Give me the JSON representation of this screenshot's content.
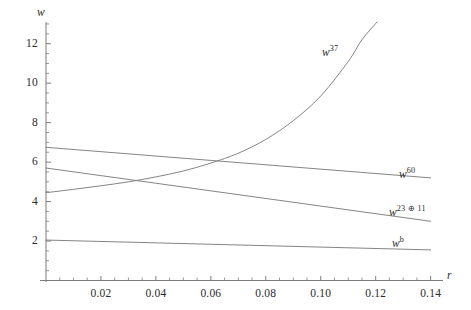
{
  "figure": {
    "background": "#ffffff",
    "line_color": "#7d7d7d",
    "axis_color": "#6e6e6e",
    "text_color": "#2b2b2b"
  },
  "axes": {
    "x_axis_name": "r",
    "y_axis_name": "w",
    "x_ticks": [
      "0.02",
      "0.04",
      "0.06",
      "0.08",
      "0.10",
      "0.12",
      "0.14"
    ],
    "x_tick_values": [
      0.02,
      0.04,
      0.06,
      0.08,
      0.1,
      0.12,
      0.14
    ],
    "y_ticks": [
      "2",
      "4",
      "6",
      "8",
      "10",
      "12"
    ],
    "y_tick_values": [
      2,
      4,
      6,
      8,
      10,
      12
    ],
    "xlim": [
      0,
      0.1445
    ],
    "ylim": [
      0,
      13.1
    ],
    "x_minor_per_major": 4,
    "y_minor_per_major": 4,
    "grid": false
  },
  "labels": {
    "curve_37_base": "w",
    "curve_37_exp": "37",
    "curve_60_base": "w",
    "curve_60_exp": "60",
    "curve_23x11_base": "w",
    "curve_23x11_exp": "23 ⊕ 11",
    "curve_b_base": "w",
    "curve_b_exp": "b"
  },
  "chart_data": {
    "type": "line",
    "title": "",
    "xlabel": "r",
    "ylabel": "w",
    "xlim": [
      0,
      0.1445
    ],
    "ylim": [
      0,
      13.1
    ],
    "grid": false,
    "legend": "inline-curve-labels",
    "series": [
      {
        "name": "w^37",
        "label": "w^37",
        "annotation_at": {
          "r": 0.098,
          "w": 10.6
        },
        "x": [
          0.0,
          0.01,
          0.02,
          0.03,
          0.04,
          0.05,
          0.06,
          0.07,
          0.08,
          0.09,
          0.1,
          0.11,
          0.115,
          0.1205
        ],
        "y": [
          4.45,
          4.62,
          4.8,
          5.0,
          5.25,
          5.55,
          5.95,
          6.45,
          7.15,
          8.1,
          9.35,
          11.1,
          12.2,
          13.1
        ]
      },
      {
        "name": "w^60",
        "label": "w^60",
        "annotation_at": {
          "r": 0.128,
          "w": 5.9
        },
        "x": [
          0.0,
          0.14
        ],
        "y": [
          6.75,
          5.2
        ]
      },
      {
        "name": "w^23+11",
        "label": "w^23 ⊕ 11",
        "annotation_at": {
          "r": 0.127,
          "w": 3.85
        },
        "x": [
          0.0,
          0.14
        ],
        "y": [
          5.7,
          3.0
        ]
      },
      {
        "name": "w^b",
        "label": "w^b",
        "annotation_at": {
          "r": 0.127,
          "w": 2.25
        },
        "x": [
          0.0,
          0.14
        ],
        "y": [
          2.05,
          1.55
        ]
      }
    ],
    "crossings": [
      {
        "between": [
          "w^37",
          "w^23+11"
        ],
        "r": 0.0335,
        "w": 5.05
      },
      {
        "between": [
          "w^37",
          "w^60"
        ],
        "r": 0.0645,
        "w": 6.1
      }
    ]
  }
}
